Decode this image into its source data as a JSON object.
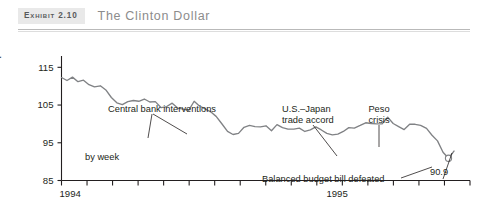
{
  "header": {
    "exhibit_tag": "Exhibit 2.10",
    "title": "The Clinton Dollar"
  },
  "chart_data": {
    "type": "line",
    "title": "The Clinton Dollar",
    "xlabel": "",
    "ylabel": "Yen per dollar",
    "note": "by week",
    "ylim": [
      85,
      118
    ],
    "yticks": [
      85,
      95,
      105,
      115
    ],
    "ytick_labels": [
      "85",
      "95",
      "105",
      "115"
    ],
    "xlim": [
      0,
      100
    ],
    "xtick_labels": [
      "1994",
      "1995"
    ],
    "xtick_label_positions": [
      0,
      68
    ],
    "n_xticks": 17,
    "grid": false,
    "legend": false,
    "series_color": "#808285",
    "x": [
      0.0,
      1.4,
      2.8,
      4.2,
      5.6,
      7.0,
      8.4,
      9.9,
      11.3,
      12.7,
      14.1,
      15.5,
      16.9,
      18.3,
      19.7,
      21.1,
      22.5,
      23.9,
      25.4,
      26.8,
      28.2,
      29.6,
      31.0,
      32.4,
      33.8,
      35.2,
      36.6,
      38.0,
      39.4,
      40.8,
      42.3,
      43.7,
      45.1,
      46.5,
      47.9,
      49.3,
      50.7,
      52.1,
      53.5,
      54.9,
      56.3,
      57.7,
      59.2,
      60.6,
      62.0,
      63.4,
      64.8,
      66.2,
      67.6,
      69.0,
      70.4,
      71.8,
      73.2,
      74.6,
      76.1,
      77.5,
      78.9,
      80.3,
      81.7,
      83.1,
      84.5,
      85.9,
      87.3,
      88.7,
      90.1,
      91.5,
      93.0,
      94.4,
      95.8,
      97.2,
      98.6,
      100.0
    ],
    "values": [
      112.3,
      111.5,
      112.4,
      111.2,
      111.6,
      110.4,
      109.8,
      110.1,
      109.0,
      107.0,
      105.6,
      105.1,
      105.9,
      106.2,
      106.0,
      106.6,
      105.8,
      105.9,
      104.3,
      104.6,
      105.5,
      104.2,
      103.9,
      103.6,
      106.0,
      104.7,
      104.0,
      103.2,
      102.0,
      100.1,
      98.0,
      97.2,
      97.5,
      99.1,
      99.6,
      99.3,
      99.2,
      99.5,
      98.2,
      99.8,
      99.0,
      98.6,
      98.6,
      98.9,
      98.0,
      98.4,
      99.2,
      98.4,
      97.5,
      97.1,
      97.3,
      98.0,
      99.0,
      98.9,
      99.6,
      100.3,
      100.1,
      100.0,
      100.0,
      101.8,
      100.1,
      99.3,
      98.5,
      99.9,
      99.9,
      99.6,
      98.8,
      97.0,
      95.5,
      92.5,
      90.9,
      92.8
    ],
    "endpoint": {
      "label": "90.9",
      "value": 90.9,
      "marker": "open-circle"
    },
    "annotations": [
      {
        "text": "Central bank interventions",
        "x_px": 108,
        "y_px": 75,
        "arrows": 2
      },
      {
        "text": "U.S.–Japan",
        "x_px": 282,
        "y_px": 75
      },
      {
        "text": "trade accord",
        "x_px": 282,
        "y_px": 86
      },
      {
        "text": "Peso",
        "x_px": 379,
        "y_px": 75
      },
      {
        "text": "crisis",
        "x_px": 379,
        "y_px": 86
      },
      {
        "text": "Balanced budget bill defeated",
        "x_px": 283,
        "y_px": 147
      },
      {
        "text": "90.9",
        "x_px": 443,
        "y_px": 140
      }
    ]
  }
}
